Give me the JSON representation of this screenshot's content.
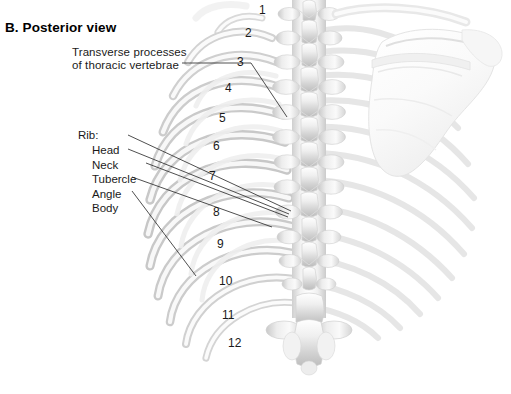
{
  "panel": {
    "title": "B. Posterior view"
  },
  "annotations": {
    "transverse_processes": {
      "line1": "Transverse processes",
      "line2": "of thoracic vertebrae"
    },
    "rib_group": {
      "heading": "Rib:",
      "parts": [
        "Head",
        "Neck",
        "Tubercle",
        "Angle",
        "Body"
      ]
    }
  },
  "rib_numbers": [
    "1",
    "2",
    "3",
    "4",
    "5",
    "6",
    "7",
    "8",
    "9",
    "10",
    "11",
    "12"
  ],
  "figure": {
    "structures": [
      "ribs",
      "thoracic-vertebrae",
      "scapula",
      "clavicle",
      "lumbar-vertebra"
    ],
    "view": "posterior"
  },
  "colors": {
    "background": "#ffffff",
    "text": "#1a1a1a",
    "leader_line": "#333333",
    "bone_light": "#f4f4f4",
    "bone_mid": "#dcdcdc",
    "bone_shadow": "#b8b8b8",
    "bone_outline": "#c9c9c9"
  }
}
